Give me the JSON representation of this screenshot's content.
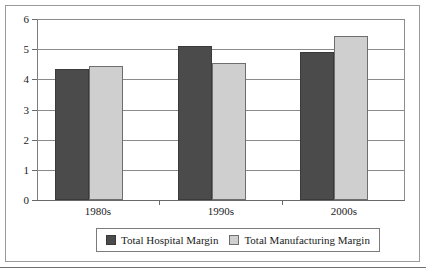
{
  "chart_data": {
    "type": "bar",
    "title": "",
    "subtitle": "",
    "xlabel": "",
    "ylabel": "",
    "categories": [
      "1980s",
      "1990s",
      "2000s"
    ],
    "series": [
      {
        "name": "Total Hospital Margin",
        "color": "#4b4b4b",
        "values": [
          4.35,
          5.12,
          4.9
        ]
      },
      {
        "name": "Total Manufacturing Margin",
        "color": "#cfcfcf",
        "values": [
          4.45,
          4.55,
          5.45
        ]
      }
    ],
    "ylim": [
      0,
      6
    ],
    "ytick_labels": [
      "0",
      "1",
      "2",
      "3",
      "4",
      "5",
      "6"
    ],
    "ytick_values": [
      0,
      1,
      2,
      3,
      4,
      5,
      6
    ],
    "grid": true,
    "legend_position": "bottom"
  }
}
